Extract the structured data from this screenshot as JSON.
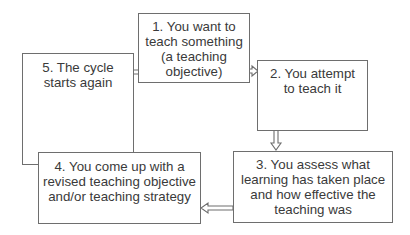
{
  "diagram": {
    "type": "cycle-flowchart",
    "steps": [
      {
        "id": 1,
        "lines": [
          "1. You want to",
          "teach something",
          "(a teaching",
          "objective)"
        ]
      },
      {
        "id": 2,
        "lines": [
          "2. You attempt",
          "to teach it"
        ]
      },
      {
        "id": 3,
        "lines": [
          "3. You assess what",
          "learning has taken place",
          "and how effective the",
          "teaching was"
        ]
      },
      {
        "id": 4,
        "lines": [
          "4. You come up with a",
          "revised teaching objective",
          "and/or teaching strategy"
        ]
      },
      {
        "id": 5,
        "lines": [
          "5. The cycle",
          "starts again"
        ]
      }
    ],
    "connections": [
      {
        "from": 5,
        "to": 1,
        "direction": "right"
      },
      {
        "from": 1,
        "to": 2,
        "direction": "right"
      },
      {
        "from": 2,
        "to": 3,
        "direction": "down"
      },
      {
        "from": 3,
        "to": 4,
        "direction": "left"
      },
      {
        "from": 4,
        "to": 5,
        "direction": "up"
      }
    ],
    "colors": {
      "border": "#6e6e6e",
      "text": "#3a3a3a",
      "background": "#ffffff"
    }
  }
}
